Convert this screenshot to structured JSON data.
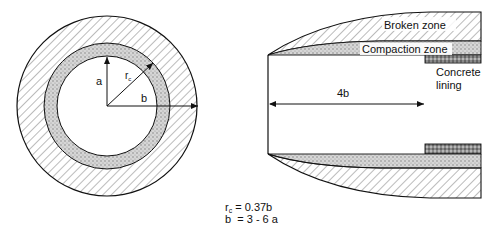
{
  "cross_section": {
    "label_a": "a",
    "label_b": "b",
    "label_rc": "r",
    "label_rc_sub": "c"
  },
  "longitudinal_section": {
    "zones": {
      "broken": "Broken zone",
      "compaction": "Compaction zone",
      "lining_line1": "Concrete",
      "lining_line2": "lining"
    },
    "dimension_label": "4b"
  },
  "formulas": {
    "rc_symbol": "r",
    "rc_sub": "c",
    "rc_value": " = 0.37b",
    "b_line": "b  = 3 - 6 a"
  },
  "colors": {
    "line": "#111111",
    "hatch": "#555555",
    "compaction_fill": "#cfcfcf",
    "lining_fill": "#7a7a7a"
  }
}
